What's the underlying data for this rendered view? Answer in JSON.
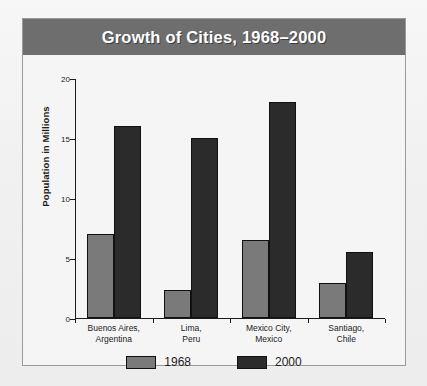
{
  "title": "Growth of Cities, 1968–2000",
  "colors": {
    "title_bar_bg": "#6e6e6e",
    "title_text": "#ffffff",
    "panel_bg": "#f5f5f5",
    "page_bg": "#f2f2f2",
    "series_1968": "#7a7a7a",
    "series_2000": "#2b2b2b",
    "axis": "#1c1c1c"
  },
  "legend": {
    "items": [
      {
        "label": "1968",
        "color": "#7a7a7a"
      },
      {
        "label": "2000",
        "color": "#2b2b2b"
      }
    ]
  },
  "chart_data": {
    "type": "bar",
    "title": "Growth of Cities, 1968–2000",
    "xlabel": "",
    "ylabel": "Population in Millions",
    "ylim": [
      0,
      20
    ],
    "yticks": [
      0,
      5,
      10,
      15,
      20
    ],
    "ytick_labels": [
      "0",
      "5",
      "10",
      "15",
      "20"
    ],
    "grid": false,
    "legend_position": "bottom",
    "categories": [
      "Buenos Aires,\nArgentina",
      "Lima,\nPeru",
      "Mexico City,\nMexico",
      "Santiago,\nChile"
    ],
    "category_lines": [
      [
        "Buenos Aires,",
        "Argentina"
      ],
      [
        "Lima,",
        "Peru"
      ],
      [
        "Mexico City,",
        "Mexico"
      ],
      [
        "Santiago,",
        "Chile"
      ]
    ],
    "series": [
      {
        "name": "1968",
        "color": "#7a7a7a",
        "values": [
          7.0,
          2.3,
          6.5,
          2.9
        ]
      },
      {
        "name": "2000",
        "color": "#2b2b2b",
        "values": [
          16.0,
          15.0,
          18.0,
          5.5
        ]
      }
    ]
  }
}
